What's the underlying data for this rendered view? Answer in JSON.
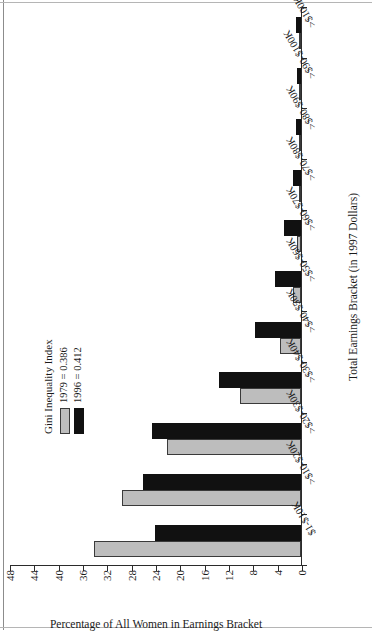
{
  "chart_data": {
    "type": "bar",
    "title": "",
    "xlabel": "Total Earnings Bracket (in 1997 Dollars)",
    "ylabel": "Percentage of All Women in Earnings Bracket",
    "ylim": [
      0,
      48
    ],
    "ytick_labels": [
      "0",
      "4",
      "8",
      "12",
      "16",
      "20",
      "24",
      "28",
      "32",
      "36",
      "40",
      "44",
      "48"
    ],
    "ytick_values": [
      0,
      4,
      8,
      12,
      16,
      20,
      24,
      28,
      32,
      36,
      40,
      44,
      48
    ],
    "grid": false,
    "orientation": "rotated-90-ccw",
    "legend_position": "upper-center",
    "categories": [
      "$1-$10K",
      ">$10-$20K",
      ">$20-$30K",
      ">$30-$40K",
      ">$40-$50K",
      ">$50-$60K",
      ">$60-$70K",
      ">$70-$80K",
      ">$80-$90K",
      ">$90-$100K",
      ">$100K"
    ],
    "series": [
      {
        "name": "1979 = 0.386",
        "year": "1979",
        "color": "#bdbdbd",
        "values": [
          34.0,
          29.5,
          22.0,
          10.0,
          3.5,
          1.3,
          0.6,
          0.4,
          0.3,
          0.25,
          0.3
        ]
      },
      {
        "name": "1996 = 0.412",
        "year": "1996",
        "color": "#111111",
        "values": [
          24.0,
          26.0,
          24.5,
          13.5,
          7.5,
          4.2,
          2.8,
          1.3,
          0.8,
          0.7,
          0.9
        ]
      }
    ]
  },
  "legend": {
    "title": "Gini Inequality Index",
    "entries": [
      {
        "label": "1979 = 0.386",
        "color": "#bdbdbd"
      },
      {
        "label": "1996 = 0.412",
        "color": "#111111"
      }
    ]
  },
  "axes": {
    "value_axis_title": "Percentage of All Women in Earnings Bracket",
    "category_axis_title": "Total Earnings Bracket (in 1997 Dollars)"
  }
}
